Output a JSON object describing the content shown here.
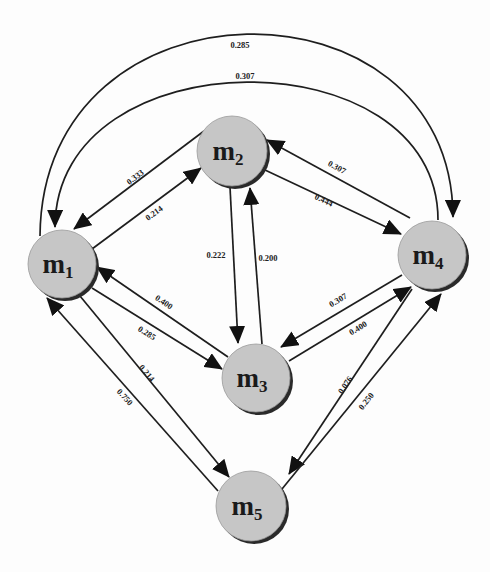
{
  "diagram": {
    "type": "directed-graph",
    "nodes": [
      {
        "id": "m1",
        "label": "m",
        "sub": "1"
      },
      {
        "id": "m2",
        "label": "m",
        "sub": "2"
      },
      {
        "id": "m3",
        "label": "m",
        "sub": "3"
      },
      {
        "id": "m4",
        "label": "m",
        "sub": "4"
      },
      {
        "id": "m5",
        "label": "m",
        "sub": "5"
      }
    ],
    "edges": [
      {
        "from": "m1",
        "to": "m4",
        "weight": "0.285"
      },
      {
        "from": "m4",
        "to": "m1",
        "weight": "0.307"
      },
      {
        "from": "m2",
        "to": "m1",
        "weight": "0.333"
      },
      {
        "from": "m1",
        "to": "m2",
        "weight": "0.214"
      },
      {
        "from": "m4",
        "to": "m2",
        "weight": "0.307"
      },
      {
        "from": "m2",
        "to": "m4",
        "weight": "0.444"
      },
      {
        "from": "m2",
        "to": "m3",
        "weight": "0.222"
      },
      {
        "from": "m3",
        "to": "m2",
        "weight": "0.200"
      },
      {
        "from": "m3",
        "to": "m1",
        "weight": "0.400"
      },
      {
        "from": "m1",
        "to": "m3",
        "weight": "0.285"
      },
      {
        "from": "m1",
        "to": "m5",
        "weight": "0.214"
      },
      {
        "from": "m5",
        "to": "m1",
        "weight": "0.750"
      },
      {
        "from": "m4",
        "to": "m3",
        "weight": "0.307"
      },
      {
        "from": "m3",
        "to": "m4",
        "weight": "0.400"
      },
      {
        "from": "m4",
        "to": "m5",
        "weight": "0.076"
      },
      {
        "from": "m5",
        "to": "m4",
        "weight": "0.250"
      }
    ]
  }
}
